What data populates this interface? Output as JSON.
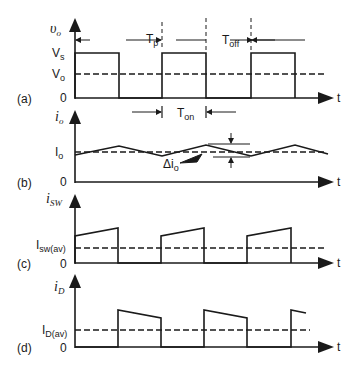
{
  "figure": {
    "panels": [
      {
        "id": "a",
        "tag": "(a)",
        "y_label": "υ",
        "y_label_sub": "o",
        "levels": [
          {
            "label": "V",
            "sub": "s"
          },
          {
            "label": "V",
            "sub": "o"
          },
          {
            "label": "0"
          }
        ],
        "x_label": "t"
      },
      {
        "id": "b",
        "tag": "(b)",
        "y_label": "i",
        "y_label_sub": "o",
        "levels": [
          {
            "label": "I",
            "sub": "o"
          },
          {
            "label": "0"
          }
        ],
        "x_label": "t",
        "ripple_label": "Δi",
        "ripple_sub": "o"
      },
      {
        "id": "c",
        "tag": "(c)",
        "y_label": "i",
        "y_label_sub": "SW",
        "levels": [
          {
            "label": "I",
            "sub": "sw(av)"
          },
          {
            "label": "0"
          }
        ],
        "x_label": "t"
      },
      {
        "id": "d",
        "tag": "(d)",
        "y_label": "i",
        "y_label_sub": "D",
        "levels": [
          {
            "label": "I",
            "sub": "D(av)"
          },
          {
            "label": "0"
          }
        ],
        "x_label": "t"
      }
    ],
    "annotations": {
      "tp": {
        "label": "T",
        "sub": "p"
      },
      "toff": {
        "label": "T",
        "sub": "off"
      },
      "ton": {
        "label": "T",
        "sub": "on"
      }
    },
    "colors": {
      "ink": "#1a1a1a",
      "background": "#ffffff"
    }
  }
}
